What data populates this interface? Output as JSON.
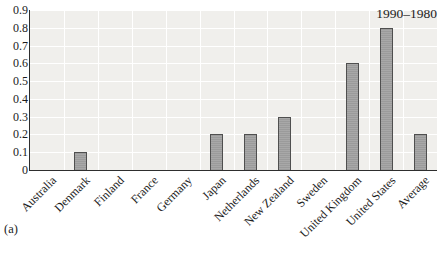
{
  "figure": {
    "panel_label": "(a)",
    "annotation": "1990–1980"
  },
  "chart_data": {
    "type": "bar",
    "title": "",
    "xlabel": "",
    "ylabel": "",
    "categories": [
      "Australia",
      "Denmark",
      "Finland",
      "France",
      "Germany",
      "Japan",
      "Netherlands",
      "New Zealand",
      "Sweden",
      "United Kingdom",
      "United States",
      "Average"
    ],
    "values": [
      0,
      0.1,
      0,
      0,
      0,
      0.2,
      0.2,
      0.3,
      0,
      0.6,
      0.8,
      0.2
    ],
    "annotation": "1990–1980",
    "panel_label": "(a)",
    "ylim": [
      0,
      0.9
    ],
    "ytick_step": 0.1,
    "yticks": [
      "0.9",
      "0.8",
      "0.7",
      "0.6",
      "0.5",
      "0.4",
      "0.3",
      "0.2",
      "0.1",
      "0"
    ],
    "grid": true,
    "legend_position": "none",
    "colors": {
      "bar_fill": "#a3a3a3",
      "bar_border": "#4f4f4f",
      "plot_bg": "#f0efec",
      "gridline": "#ffffff",
      "axis": "#2e2e2e",
      "text": "#1c1c1c",
      "page_bg": "#ffffff"
    }
  }
}
